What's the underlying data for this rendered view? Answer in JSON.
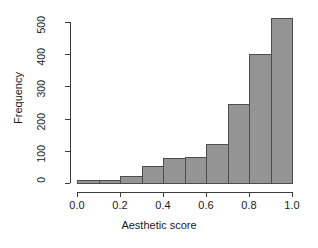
{
  "chart_data": {
    "type": "bar",
    "title": "",
    "subtitle": "",
    "xlabel": "Aesthetic score",
    "ylabel": "Frequency",
    "categories": [
      "0.0-0.1",
      "0.1-0.2",
      "0.2-0.3",
      "0.3-0.4",
      "0.4-0.5",
      "0.5-0.6",
      "0.6-0.7",
      "0.7-0.8",
      "0.8-0.9",
      "0.9-1.0"
    ],
    "bin_edges": [
      0.0,
      0.1,
      0.2,
      0.3,
      0.4,
      0.5,
      0.6,
      0.7,
      0.8,
      0.9,
      1.0
    ],
    "values": [
      8,
      10,
      22,
      53,
      78,
      80,
      122,
      245,
      400,
      512
    ],
    "xlim": [
      0.0,
      1.0
    ],
    "ylim": [
      0,
      520
    ],
    "xticks": [
      "0.0",
      "0.2",
      "0.4",
      "0.6",
      "0.8",
      "1.0"
    ],
    "xtick_values": [
      0.0,
      0.2,
      0.4,
      0.6,
      0.8,
      1.0
    ],
    "yticks": [
      "0",
      "100",
      "200",
      "300",
      "400",
      "500"
    ],
    "ytick_values": [
      0,
      100,
      200,
      300,
      400,
      500
    ],
    "grid": false,
    "legend": "none",
    "bar_color": "#949494",
    "bar_border_color": "#4d4d4d",
    "axis_color": "#3d3d3d",
    "background": "#ffffff"
  }
}
